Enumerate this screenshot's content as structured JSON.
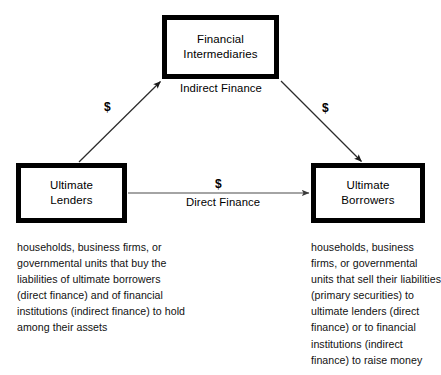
{
  "diagram": {
    "nodes": {
      "financial_intermediaries": {
        "label": "Financial\nIntermediaries"
      },
      "ultimate_lenders": {
        "label": "Ultimate\nLenders"
      },
      "ultimate_borrowers": {
        "label": "Ultimate\nBorrowers"
      }
    },
    "edge_labels": {
      "indirect_finance": "Indirect Finance",
      "direct_finance": "Direct Finance"
    },
    "money_symbols": {
      "lenders_to_intermediaries": "$",
      "intermediaries_to_borrowers": "$",
      "lenders_to_borrowers": "$"
    },
    "captions": {
      "lenders": "households, business firms, or governmental units that buy the liabilities of ultimate borrowers (direct finance) and of financial institutions (indirect finance) to hold among their assets",
      "borrowers": "households, business firms, or governmental units that sell their liabilities (primary securities) to ultimate lenders (direct finance) or to financial institutions (indirect finance) to raise money"
    },
    "colors": {
      "box_border": "#000000",
      "box_fill": "#ffffff",
      "arrow": "#333333",
      "text": "#000000",
      "background": "#ffffff"
    }
  }
}
